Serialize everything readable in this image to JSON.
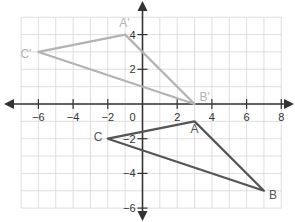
{
  "chart_data": {
    "type": "diagram",
    "title": "",
    "grid": true,
    "xlim": [
      -7,
      8
    ],
    "ylim": [
      -6,
      5
    ],
    "x_ticks": [
      -6,
      -4,
      -2,
      2,
      4,
      6,
      8
    ],
    "y_ticks": [
      4,
      2,
      -2,
      -4,
      -6
    ],
    "origin_label": "0",
    "shapes": [
      {
        "name": "image-triangle",
        "color": "#b3b3b3",
        "vertices": [
          {
            "label": "A'",
            "x": -1,
            "y": 4
          },
          {
            "label": "B'",
            "x": 3,
            "y": 0
          },
          {
            "label": "C'",
            "x": -6,
            "y": 3
          }
        ]
      },
      {
        "name": "original-triangle",
        "color": "#555555",
        "vertices": [
          {
            "label": "A",
            "x": 3,
            "y": -1
          },
          {
            "label": "B",
            "x": 7,
            "y": -5
          },
          {
            "label": "C",
            "x": -2,
            "y": -2
          }
        ]
      }
    ]
  }
}
